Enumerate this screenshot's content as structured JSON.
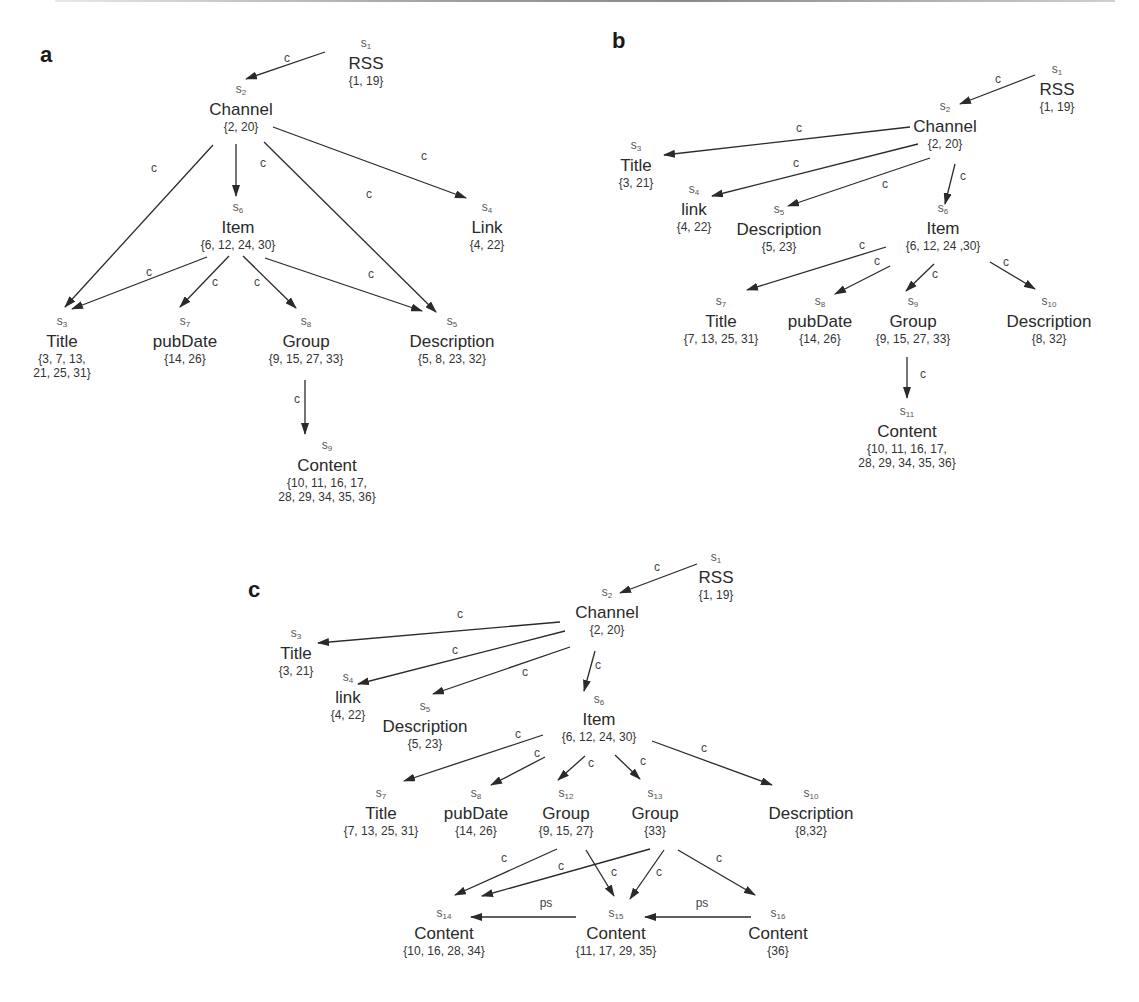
{
  "figure": {
    "panels": [
      {
        "label": "a",
        "nodes": [
          {
            "id": "s1",
            "sub": "1",
            "name": "RSS",
            "set": "{1, 19}"
          },
          {
            "id": "s2",
            "sub": "2",
            "name": "Channel",
            "set": "{2, 20}"
          },
          {
            "id": "s6",
            "sub": "6",
            "name": "Item",
            "set": "{6, 12, 24, 30}"
          },
          {
            "id": "s4",
            "sub": "4",
            "name": "Link",
            "set": "{4, 22}"
          },
          {
            "id": "s3",
            "sub": "3",
            "name": "Title",
            "set": "{3, 7, 13,",
            "set2": "21, 25, 31}"
          },
          {
            "id": "s7",
            "sub": "7",
            "name": "pubDate",
            "set": "{14, 26}"
          },
          {
            "id": "s8",
            "sub": "8",
            "name": "Group",
            "set": "{9, 15, 27, 33}"
          },
          {
            "id": "s5",
            "sub": "5",
            "name": "Description",
            "set": "{5, 8, 23, 32}"
          },
          {
            "id": "s9",
            "sub": "9",
            "name": "Content",
            "set": "{10, 11, 16, 17,",
            "set2": "28, 29, 34, 35, 36}"
          }
        ],
        "edge_label": "c"
      },
      {
        "label": "b",
        "nodes": [
          {
            "id": "s1",
            "sub": "1",
            "name": "RSS",
            "set": "{1, 19}"
          },
          {
            "id": "s2",
            "sub": "2",
            "name": "Channel",
            "set": "{2, 20}"
          },
          {
            "id": "s3",
            "sub": "3",
            "name": "Title",
            "set": "{3, 21}"
          },
          {
            "id": "s4",
            "sub": "4",
            "name": "link",
            "set": "{4, 22}"
          },
          {
            "id": "s5",
            "sub": "5",
            "name": "Description",
            "set": "{5, 23}"
          },
          {
            "id": "s6",
            "sub": "6",
            "name": "Item",
            "set": "{6, 12, 24 ,30}"
          },
          {
            "id": "s7",
            "sub": "7",
            "name": "Title",
            "set": "{7, 13, 25, 31}"
          },
          {
            "id": "s8",
            "sub": "8",
            "name": "pubDate",
            "set": "{14,  26}"
          },
          {
            "id": "s9",
            "sub": "9",
            "name": "Group",
            "set": "{9, 15, 27, 33}"
          },
          {
            "id": "s10",
            "sub": "10",
            "name": "Description",
            "set": "{8, 32}"
          },
          {
            "id": "s11",
            "sub": "11",
            "name": "Content",
            "set": "{10, 11, 16, 17,",
            "set2": "28, 29, 34, 35, 36}"
          }
        ],
        "edge_label": "c"
      },
      {
        "label": "c",
        "nodes": [
          {
            "id": "s1",
            "sub": "1",
            "name": "RSS",
            "set": "{1, 19}"
          },
          {
            "id": "s2",
            "sub": "2",
            "name": "Channel",
            "set": "{2, 20}"
          },
          {
            "id": "s3",
            "sub": "3",
            "name": "Title",
            "set": "{3, 21}"
          },
          {
            "id": "s4",
            "sub": "4",
            "name": "link",
            "set": "{4, 22}"
          },
          {
            "id": "s5",
            "sub": "5",
            "name": "Description",
            "set": "{5, 23}"
          },
          {
            "id": "s6",
            "sub": "6",
            "name": "Item",
            "set": "{6, 12, 24, 30}"
          },
          {
            "id": "s7",
            "sub": "7",
            "name": "Title",
            "set": "{7, 13, 25, 31}"
          },
          {
            "id": "s8",
            "sub": "8",
            "name": "pubDate",
            "set": "{14, 26}"
          },
          {
            "id": "s12",
            "sub": "12",
            "name": "Group",
            "set": "{9, 15, 27}"
          },
          {
            "id": "s13",
            "sub": "13",
            "name": "Group",
            "set": "{33}"
          },
          {
            "id": "s10",
            "sub": "10",
            "name": "Description",
            "set": "{8,32}"
          },
          {
            "id": "s14",
            "sub": "14",
            "name": "Content",
            "set": "{10, 16, 28, 34}"
          },
          {
            "id": "s15",
            "sub": "15",
            "name": "Content",
            "set": "{11, 17, 29, 35}"
          },
          {
            "id": "s16",
            "sub": "16",
            "name": "Content",
            "set": "{36}"
          }
        ],
        "edge_label": "c",
        "ps_label": "ps"
      }
    ],
    "edges": {
      "a": [
        [
          "s1",
          "s2",
          "c"
        ],
        [
          "s2",
          "s3",
          "c"
        ],
        [
          "s2",
          "s6",
          "c"
        ],
        [
          "s2",
          "s5",
          "c"
        ],
        [
          "s2",
          "s4",
          "c"
        ],
        [
          "s6",
          "s3",
          "c"
        ],
        [
          "s6",
          "s7",
          "c"
        ],
        [
          "s6",
          "s8",
          "c"
        ],
        [
          "s6",
          "s5",
          "c"
        ],
        [
          "s8",
          "s9",
          "c"
        ]
      ],
      "b": [
        [
          "s1",
          "s2",
          "c"
        ],
        [
          "s2",
          "s3",
          "c"
        ],
        [
          "s2",
          "s4",
          "c"
        ],
        [
          "s2",
          "s5",
          "c"
        ],
        [
          "s2",
          "s6",
          "c"
        ],
        [
          "s6",
          "s7",
          "c"
        ],
        [
          "s6",
          "s8",
          "c"
        ],
        [
          "s6",
          "s9",
          "c"
        ],
        [
          "s6",
          "s10",
          "c"
        ],
        [
          "s9",
          "s11",
          "c"
        ]
      ],
      "c": [
        [
          "s1",
          "s2",
          "c"
        ],
        [
          "s2",
          "s3",
          "c"
        ],
        [
          "s2",
          "s4",
          "c"
        ],
        [
          "s2",
          "s5",
          "c"
        ],
        [
          "s2",
          "s6",
          "c"
        ],
        [
          "s6",
          "s7",
          "c"
        ],
        [
          "s6",
          "s8",
          "c"
        ],
        [
          "s6",
          "s12",
          "c"
        ],
        [
          "s6",
          "s13",
          "c"
        ],
        [
          "s6",
          "s10",
          "c"
        ],
        [
          "s12",
          "s14",
          "c"
        ],
        [
          "s12",
          "s15",
          "c"
        ],
        [
          "s13",
          "s14",
          "c"
        ],
        [
          "s13",
          "s15",
          "c"
        ],
        [
          "s13",
          "s16",
          "c"
        ],
        [
          "s15",
          "s14",
          "ps"
        ],
        [
          "s16",
          "s15",
          "ps"
        ]
      ]
    }
  }
}
